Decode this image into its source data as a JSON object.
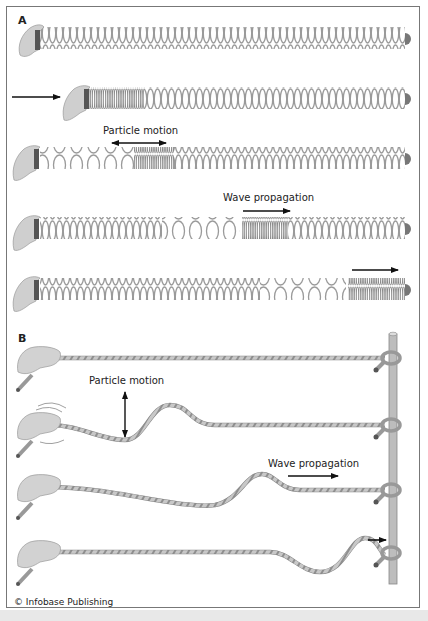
{
  "figure": {
    "panels": [
      {
        "label": "A",
        "subject": "spring (longitudinal wave)",
        "rows": [
          {
            "step": 1,
            "state": "spring at rest, hand holding left end",
            "annotation": ""
          },
          {
            "step": 2,
            "state": "hand pushes spring, compression at left end",
            "annotation": "",
            "arrow": "right, left of hand"
          },
          {
            "step": 3,
            "state": "compression moves right",
            "annotation": "Particle motion",
            "arrow": "double-headed horizontal"
          },
          {
            "step": 4,
            "state": "compression further right",
            "annotation": "Wave propagation",
            "arrow": "right"
          },
          {
            "step": 5,
            "state": "compression reaches fixed right end",
            "annotation": "",
            "arrow": "right"
          }
        ]
      },
      {
        "label": "B",
        "subject": "rope tied to post (transverse wave)",
        "rows": [
          {
            "step": 1,
            "state": "rope at rest",
            "annotation": ""
          },
          {
            "step": 2,
            "state": "hand shakes, hump forms near hand",
            "annotation": "Particle motion",
            "arrow": "double-headed vertical"
          },
          {
            "step": 3,
            "state": "hump travels right",
            "annotation": "Wave propagation",
            "arrow": "right"
          },
          {
            "step": 4,
            "state": "hump reaches post",
            "annotation": "",
            "arrow": "right"
          }
        ]
      }
    ],
    "labels": {
      "panel_a": "A",
      "panel_b": "B",
      "a_particle_motion": "Particle motion",
      "a_wave_propagation": "Wave propagation",
      "b_particle_motion": "Particle motion",
      "b_wave_propagation": "Wave propagation"
    },
    "credit": "© Infobase Publishing",
    "colors": {
      "spring": "#9a9a9a",
      "rope": "#a8a8a8",
      "hand": "#cfcfcf",
      "post": "#b8b8b8",
      "arrow": "#111111",
      "border": "#777777"
    }
  }
}
